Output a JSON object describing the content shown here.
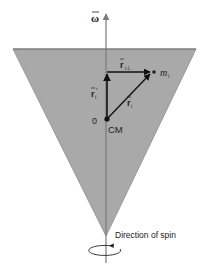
{
  "diagram": {
    "axis": {
      "label": "ω",
      "label_vector_mark": "→"
    },
    "labels": {
      "r_perp": {
        "base": "r",
        "sub": "i⊥"
      },
      "r_parallel": {
        "base": "r",
        "sub": "i",
        "prime": "′"
      },
      "r_i": {
        "base": "r",
        "sub": "i"
      },
      "mass": {
        "base": "m",
        "sub": "i"
      },
      "origin": "0",
      "cm": "CM",
      "spin": "Direction of spin"
    },
    "colors": {
      "body_fill": "#a9a9a9",
      "body_edge": "#6f6f6f",
      "axis": "#7a7a7a",
      "vector": "#111111",
      "text": "#222222"
    }
  }
}
